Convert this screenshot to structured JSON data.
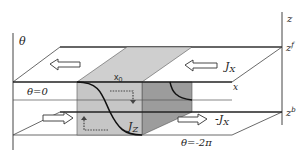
{
  "diagram": {
    "type": "schematic",
    "axes": {
      "left_axis_label": "θ",
      "right_axis_label": "z",
      "top_plane_label": "z",
      "top_plane_sup": "f",
      "bottom_plane_label": "z",
      "bottom_plane_sup": "b",
      "x_axis_label": "x"
    },
    "labels": {
      "theta_zero": "θ=0",
      "theta_minus_2pi": "θ=-2π",
      "x0": "x",
      "x0_sub": "0",
      "jx": "J",
      "jx_sub": "X",
      "neg_jx": "-J",
      "neg_jx_sub": "X",
      "jz": "J",
      "jz_sub": "Z"
    },
    "colors": {
      "line": "#333333",
      "box_front": "#c8c8c8",
      "box_top": "#cfcfcf",
      "box_side": "#9a9a9a",
      "background": "#ffffff"
    }
  }
}
